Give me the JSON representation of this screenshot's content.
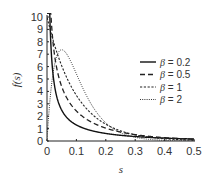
{
  "chart_data": {
    "type": "line",
    "title": "",
    "xlabel": "s",
    "ylabel": "f(s)",
    "xlim": [
      0,
      0.5
    ],
    "ylim": [
      0,
      10
    ],
    "xticks": [
      "0",
      "0.1",
      "0.2",
      "0.3",
      "0.4",
      "0.5"
    ],
    "yticks": [
      "0",
      "1",
      "2",
      "3",
      "4",
      "5",
      "6",
      "7",
      "8",
      "9",
      "10"
    ],
    "grid": false,
    "legend_position": "right",
    "mean": 0.1,
    "series": [
      {
        "name": "β = 0.2",
        "beta": 0.2,
        "style": "solid",
        "x": [
          0.005,
          0.01,
          0.02,
          0.03,
          0.05,
          0.08,
          0.1,
          0.15,
          0.2,
          0.3,
          0.4,
          0.5
        ],
        "values": [
          10.0,
          6.3,
          3.1,
          2.0,
          1.1,
          0.7,
          0.55,
          0.35,
          0.25,
          0.14,
          0.09,
          0.06
        ]
      },
      {
        "name": "β = 0.5",
        "beta": 0.5,
        "style": "dashed",
        "x": [
          0.005,
          0.01,
          0.02,
          0.03,
          0.05,
          0.08,
          0.1,
          0.15,
          0.2,
          0.3,
          0.4,
          0.5
        ],
        "values": [
          10.0,
          10.0,
          7.2,
          5.4,
          3.5,
          2.1,
          1.6,
          0.9,
          0.5,
          0.2,
          0.08,
          0.03
        ]
      },
      {
        "name": "β = 1",
        "beta": 1,
        "style": "dash-dot-fine",
        "x": [
          0,
          0.02,
          0.05,
          0.08,
          0.1,
          0.15,
          0.2,
          0.3,
          0.4,
          0.5
        ],
        "values": [
          10.0,
          8.2,
          6.1,
          4.5,
          3.7,
          2.2,
          1.4,
          0.5,
          0.18,
          0.07
        ]
      },
      {
        "name": "β = 2",
        "beta": 2,
        "style": "dotted",
        "x": [
          0,
          0.02,
          0.05,
          0.08,
          0.1,
          0.15,
          0.2,
          0.3,
          0.4,
          0.5
        ],
        "values": [
          0,
          5.4,
          7.4,
          6.5,
          5.4,
          3.0,
          1.5,
          0.3,
          0.05,
          0.01
        ]
      }
    ]
  },
  "legend": {
    "items": [
      {
        "beta_symbol": "β",
        "eq": "= 0.2"
      },
      {
        "beta_symbol": "β",
        "eq": "= 0.5"
      },
      {
        "beta_symbol": "β",
        "eq": "= 1"
      },
      {
        "beta_symbol": "β",
        "eq": "= 2"
      }
    ]
  }
}
